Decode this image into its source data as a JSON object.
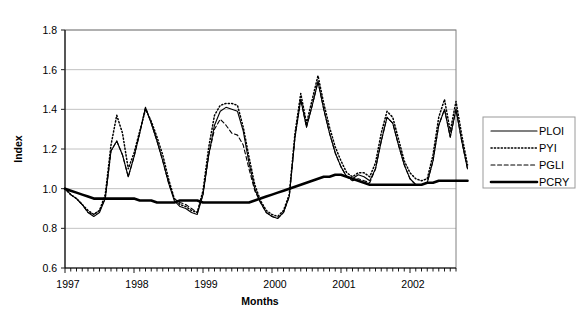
{
  "chart_data": {
    "type": "line",
    "title": "",
    "xlabel": "Months",
    "ylabel": "Index",
    "ylim": [
      0.6,
      1.8
    ],
    "ytick_step": 0.2,
    "yticks": [
      "0.6",
      "0.8",
      "1.0",
      "1.2",
      "1.4",
      "1.6",
      "1.8"
    ],
    "xticks_major": [
      "1997",
      "1998",
      "1999",
      "2000",
      "2001",
      "2002"
    ],
    "x_minor_ticks_per_year": 12,
    "x_tick_unit": "month",
    "x_range_months": [
      0,
      68
    ],
    "grid": "horizontal",
    "legend_position": "right",
    "series": [
      {
        "name": "PLOI",
        "style": "solid-thin",
        "values": [
          1.0,
          0.97,
          0.95,
          0.92,
          0.88,
          0.86,
          0.88,
          0.95,
          1.19,
          1.24,
          1.17,
          1.06,
          1.16,
          1.28,
          1.41,
          1.33,
          1.24,
          1.14,
          1.03,
          0.94,
          0.91,
          0.9,
          0.88,
          0.87,
          0.97,
          1.17,
          1.32,
          1.39,
          1.41,
          1.4,
          1.39,
          1.29,
          1.13,
          1.0,
          0.93,
          0.88,
          0.86,
          0.85,
          0.88,
          0.96,
          1.26,
          1.45,
          1.31,
          1.42,
          1.54,
          1.4,
          1.28,
          1.18,
          1.11,
          1.06,
          1.05,
          1.07,
          1.06,
          1.04,
          1.1,
          1.24,
          1.36,
          1.33,
          1.22,
          1.12,
          1.05,
          1.02,
          1.02,
          1.03,
          1.14,
          1.32,
          1.4,
          1.26,
          1.4,
          1.24,
          1.1
        ]
      },
      {
        "name": "PYI",
        "style": "dotted",
        "values": [
          1.0,
          0.97,
          0.95,
          0.92,
          0.89,
          0.87,
          0.89,
          0.97,
          1.22,
          1.37,
          1.28,
          1.1,
          1.18,
          1.29,
          1.4,
          1.34,
          1.26,
          1.17,
          1.05,
          0.95,
          0.92,
          0.91,
          0.89,
          0.88,
          0.99,
          1.21,
          1.37,
          1.42,
          1.43,
          1.43,
          1.42,
          1.31,
          1.16,
          1.02,
          0.94,
          0.89,
          0.87,
          0.86,
          0.89,
          0.97,
          1.28,
          1.48,
          1.33,
          1.45,
          1.57,
          1.43,
          1.31,
          1.21,
          1.14,
          1.08,
          1.06,
          1.08,
          1.08,
          1.06,
          1.13,
          1.28,
          1.39,
          1.36,
          1.25,
          1.14,
          1.08,
          1.05,
          1.04,
          1.05,
          1.17,
          1.36,
          1.45,
          1.29,
          1.44,
          1.27,
          1.12
        ]
      },
      {
        "name": "PGLI",
        "style": "dashed",
        "values": [
          1.0,
          0.97,
          0.95,
          0.92,
          0.88,
          0.87,
          0.89,
          0.95,
          1.19,
          1.24,
          1.17,
          1.06,
          1.16,
          1.28,
          1.41,
          1.33,
          1.24,
          1.14,
          1.03,
          0.95,
          0.93,
          0.92,
          0.9,
          0.88,
          0.97,
          1.17,
          1.3,
          1.35,
          1.32,
          1.28,
          1.27,
          1.22,
          1.1,
          0.99,
          0.93,
          0.88,
          0.86,
          0.85,
          0.88,
          0.96,
          1.26,
          1.45,
          1.31,
          1.42,
          1.54,
          1.4,
          1.28,
          1.18,
          1.11,
          1.06,
          1.04,
          1.05,
          1.04,
          1.03,
          1.1,
          1.24,
          1.36,
          1.33,
          1.22,
          1.12,
          1.05,
          1.02,
          1.02,
          1.03,
          1.14,
          1.32,
          1.4,
          1.26,
          1.4,
          1.24,
          1.1
        ]
      },
      {
        "name": "PCRY",
        "style": "solid-thick",
        "values": [
          1.0,
          0.99,
          0.98,
          0.97,
          0.96,
          0.95,
          0.95,
          0.95,
          0.95,
          0.95,
          0.95,
          0.95,
          0.95,
          0.94,
          0.94,
          0.94,
          0.93,
          0.93,
          0.93,
          0.93,
          0.94,
          0.94,
          0.94,
          0.94,
          0.93,
          0.93,
          0.93,
          0.93,
          0.93,
          0.93,
          0.93,
          0.93,
          0.93,
          0.94,
          0.95,
          0.96,
          0.97,
          0.98,
          0.99,
          1.0,
          1.01,
          1.02,
          1.03,
          1.04,
          1.05,
          1.06,
          1.06,
          1.07,
          1.07,
          1.06,
          1.05,
          1.04,
          1.03,
          1.02,
          1.02,
          1.02,
          1.02,
          1.02,
          1.02,
          1.02,
          1.02,
          1.02,
          1.02,
          1.03,
          1.03,
          1.04,
          1.04,
          1.04,
          1.04,
          1.04,
          1.04
        ]
      }
    ]
  },
  "legend": {
    "entries": [
      {
        "label": "PLOI",
        "style": "solid-thin"
      },
      {
        "label": "PYI",
        "style": "dotted"
      },
      {
        "label": "PGLI",
        "style": "dashed"
      },
      {
        "label": "PCRY",
        "style": "solid-thick"
      }
    ]
  },
  "colors": {
    "series": "#000000",
    "grid": "#b3b3b3",
    "frame": "#808080",
    "background": "#ffffff"
  }
}
